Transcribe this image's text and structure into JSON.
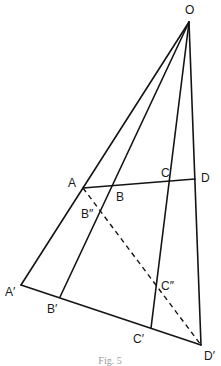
{
  "figure": {
    "caption": "Fig. 5",
    "points": {
      "O": {
        "label": "O",
        "x": 189,
        "y": 22,
        "lx": 185,
        "ly": 14
      },
      "A": {
        "label": "A",
        "x": 83,
        "y": 188,
        "lx": 68,
        "ly": 187
      },
      "B": {
        "label": "B",
        "x": 114,
        "y": 185,
        "lx": 116,
        "ly": 201
      },
      "C": {
        "label": "C",
        "x": 171,
        "y": 180,
        "lx": 161,
        "ly": 177
      },
      "D": {
        "label": "D",
        "x": 195,
        "y": 179,
        "lx": 201,
        "ly": 182
      },
      "A1": {
        "label": "A′",
        "x": 21,
        "y": 285,
        "lx": 5,
        "ly": 296
      },
      "B1": {
        "label": "B′",
        "x": 60,
        "y": 297,
        "lx": 47,
        "ly": 313
      },
      "C1": {
        "label": "C′",
        "x": 151,
        "y": 328,
        "lx": 133,
        "ly": 343
      },
      "D1": {
        "label": "D′",
        "x": 201,
        "y": 345,
        "lx": 204,
        "ly": 360
      },
      "B2": {
        "label": "B″",
        "x": 100,
        "y": 212,
        "lx": 81,
        "ly": 218
      },
      "C2": {
        "label": "C″",
        "x": 158,
        "y": 292,
        "lx": 161,
        "ly": 290
      }
    },
    "segments": [
      {
        "from": "O",
        "to": "A1",
        "style": "solid"
      },
      {
        "from": "O",
        "to": "B1",
        "style": "solid"
      },
      {
        "from": "O",
        "to": "C1",
        "style": "solid"
      },
      {
        "from": "O",
        "to": "D1",
        "style": "solid"
      },
      {
        "from": "A",
        "to": "D",
        "style": "solid"
      },
      {
        "from": "A1",
        "to": "D1",
        "style": "solid"
      },
      {
        "from": "A",
        "to": "D1",
        "style": "dashed"
      }
    ]
  }
}
